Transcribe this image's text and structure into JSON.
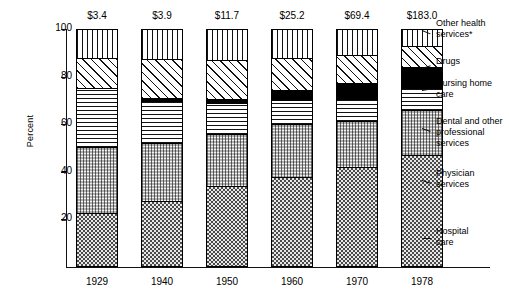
{
  "chart_data": {
    "type": "bar",
    "stacked": true,
    "title": "",
    "subtitle": "",
    "xlabel": "",
    "ylabel": "Percent",
    "ylim": [
      0,
      100
    ],
    "yticks": [
      20,
      40,
      60,
      80,
      100
    ],
    "grid": false,
    "legend_position": "right",
    "categories": [
      "1929",
      "1940",
      "1950",
      "1960",
      "1970",
      "1978"
    ],
    "bar_totals_label": [
      "$3.4",
      "$3.9",
      "$11.7",
      "$25.2",
      "$69.4",
      "$183.0"
    ],
    "bar_totals_units": "billions of dollars",
    "series": [
      {
        "name": "Hospital care",
        "pattern": "dark-checkerboard",
        "values": [
          22.8,
          27.6,
          34.0,
          38.0,
          42.0,
          47.0
        ]
      },
      {
        "name": "Physician services",
        "pattern": "light-dots",
        "values": [
          27.8,
          24.4,
          22.0,
          22.0,
          19.5,
          19.0
        ]
      },
      {
        "name": "Dental and other professional services",
        "pattern": "horizontal-lines",
        "values": [
          24.5,
          17.6,
          13.0,
          10.0,
          9.0,
          9.0
        ]
      },
      {
        "name": "Nursing home care",
        "pattern": "solid-black",
        "values": [
          0.0,
          1.2,
          1.6,
          4.5,
          7.0,
          9.0
        ]
      },
      {
        "name": "Drugs",
        "pattern": "diagonal-lines",
        "values": [
          12.7,
          16.4,
          16.4,
          13.5,
          11.5,
          9.0
        ]
      },
      {
        "name": "Other health services*",
        "pattern": "vertical-lines",
        "values": [
          12.2,
          12.8,
          13.0,
          12.0,
          11.0,
          7.0
        ]
      }
    ]
  },
  "axis": {
    "y_title": "Percent",
    "y_ticks": [
      "100",
      "80",
      "60",
      "40",
      "20"
    ],
    "x_labels": [
      "1929",
      "1940",
      "1950",
      "1960",
      "1970",
      "1978"
    ]
  },
  "value_labels": [
    "$3.4",
    "$3.9",
    "$11.7",
    "$25.2",
    "$69.4",
    "$183.0"
  ],
  "legend": {
    "items": [
      {
        "label": "Other health\nservices*",
        "pattern": "vertical-lines"
      },
      {
        "label": "Drugs",
        "pattern": "diagonal-lines"
      },
      {
        "label": "Nursing home\ncare",
        "pattern": "solid-black"
      },
      {
        "label": "Dental and other\nprofessional\nservices",
        "pattern": "horizontal-lines"
      },
      {
        "label": "Physician\nservices",
        "pattern": "light-dots"
      },
      {
        "label": "Hospital\ncare",
        "pattern": "dark-checkerboard"
      }
    ]
  },
  "colors": {
    "ink": "#111111",
    "background": "#ffffff",
    "solid_segment": "#000000"
  }
}
